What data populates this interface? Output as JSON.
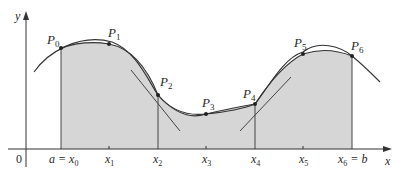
{
  "figure": {
    "axes": {
      "x_label": "x",
      "y_label": "y",
      "origin_label": "0"
    },
    "x_ticks": [
      {
        "main": "a = x",
        "sub": "0"
      },
      {
        "main": "x",
        "sub": "1"
      },
      {
        "main": "x",
        "sub": "2"
      },
      {
        "main": "x",
        "sub": "3"
      },
      {
        "main": "x",
        "sub": "4"
      },
      {
        "main": "x",
        "sub": "5"
      },
      {
        "main": "x",
        "sub": "6",
        "suffix": " = b"
      }
    ],
    "points": [
      {
        "name": "P",
        "sub": "0"
      },
      {
        "name": "P",
        "sub": "1"
      },
      {
        "name": "P",
        "sub": "2"
      },
      {
        "name": "P",
        "sub": "3"
      },
      {
        "name": "P",
        "sub": "4"
      },
      {
        "name": "P",
        "sub": "5"
      },
      {
        "name": "P",
        "sub": "6"
      }
    ],
    "colors": {
      "shade": "#d6d6d6",
      "stroke": "#333333",
      "background": "#ffffff"
    }
  }
}
